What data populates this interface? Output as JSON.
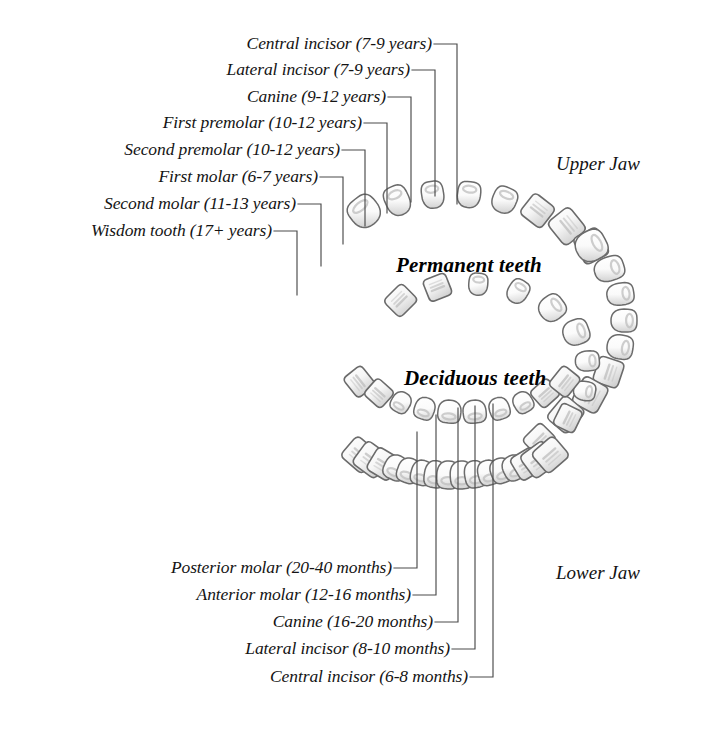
{
  "diagram": {
    "title_permanent": "Permanent teeth",
    "title_deciduous": "Deciduous teeth",
    "jaw_upper": "Upper Jaw",
    "jaw_lower": "Lower Jaw",
    "colors": {
      "background": "#ffffff",
      "ink": "#141414",
      "leader_line": "#4a4a4a",
      "tooth_outline": "#6b6b6b",
      "tooth_fill": "#fbfbfb",
      "tooth_shade": "#c9c9c9"
    }
  },
  "permanent_labels": [
    {
      "text": "Central incisor (7-9 years)",
      "tooth": "central-incisor",
      "eruption": "7-9 years",
      "y": 44,
      "text_x": 432,
      "elbow_x": 457,
      "drop_y": 204
    },
    {
      "text": "Lateral incisor (7-9 years)",
      "tooth": "lateral-incisor",
      "eruption": "7-9 years",
      "y": 70,
      "text_x": 410,
      "elbow_x": 435,
      "drop_y": 196
    },
    {
      "text": "Canine (9-12 years)",
      "tooth": "canine",
      "eruption": "9-12 years",
      "y": 97,
      "text_x": 386,
      "elbow_x": 411,
      "drop_y": 202
    },
    {
      "text": "First premolar (10-12 years)",
      "tooth": "first-premolar",
      "eruption": "10-12 years",
      "y": 123,
      "text_x": 362,
      "elbow_x": 387,
      "drop_y": 213
    },
    {
      "text": "Second premolar (10-12 years)",
      "tooth": "second-premolar",
      "eruption": "10-12 years",
      "y": 150,
      "text_x": 340,
      "elbow_x": 365,
      "drop_y": 226
    },
    {
      "text": "First molar (6-7 years)",
      "tooth": "first-molar",
      "eruption": "6-7 years",
      "y": 177,
      "text_x": 318,
      "elbow_x": 343,
      "drop_y": 244
    },
    {
      "text": "Second molar (11-13 years)",
      "tooth": "second-molar",
      "eruption": "11-13 years",
      "y": 204,
      "text_x": 296,
      "elbow_x": 321,
      "drop_y": 266
    },
    {
      "text": "Wisdom tooth (17+ years)",
      "tooth": "wisdom-tooth",
      "eruption": "17+ years",
      "y": 231,
      "text_x": 272,
      "elbow_x": 297,
      "drop_y": 295
    }
  ],
  "deciduous_labels": [
    {
      "text": "Posterior molar (20-40 months)",
      "tooth": "posterior-molar",
      "eruption": "20-40 months",
      "y": 568,
      "text_x": 392,
      "elbow_x": 417,
      "rise_y": 432
    },
    {
      "text": "Anterior molar (12-16 months)",
      "tooth": "anterior-molar",
      "eruption": "12-16 months",
      "y": 595,
      "text_x": 411,
      "elbow_x": 436,
      "rise_y": 415
    },
    {
      "text": "Canine (16-20 months)",
      "tooth": "canine",
      "eruption": "16-20 months",
      "y": 622,
      "text_x": 433,
      "elbow_x": 458,
      "rise_y": 408
    },
    {
      "text": "Lateral incisor (8-10 months)",
      "tooth": "lateral-incisor",
      "eruption": "8-10 months",
      "y": 649,
      "text_x": 450,
      "elbow_x": 475,
      "rise_y": 406
    },
    {
      "text": "Central incisor (6-8 months)",
      "tooth": "central-incisor",
      "eruption": "6-8 months",
      "y": 677,
      "text_x": 468,
      "elbow_x": 493,
      "rise_y": 404
    }
  ],
  "jaw_labels": [
    {
      "text": "Upper Jaw",
      "x": 556,
      "y": 163
    },
    {
      "text": "Lower Jaw",
      "x": 556,
      "y": 572
    }
  ],
  "dentition_titles": [
    {
      "text": "Permanent teeth",
      "x": 396,
      "y": 265
    },
    {
      "text": "Deciduous teeth",
      "x": 404,
      "y": 378
    }
  ]
}
